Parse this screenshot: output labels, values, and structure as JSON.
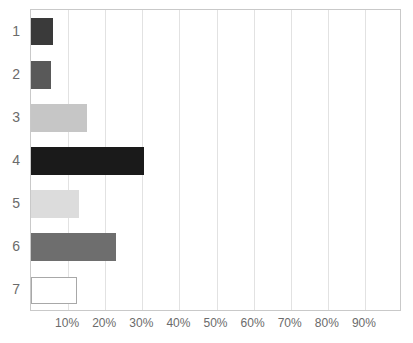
{
  "chart_data": {
    "type": "bar",
    "orientation": "horizontal",
    "title": "",
    "xlabel": "",
    "ylabel": "",
    "categories": [
      "1",
      "2",
      "3",
      "4",
      "5",
      "6",
      "7"
    ],
    "values": [
      6,
      5.5,
      15,
      30.5,
      13,
      23,
      12.5
    ],
    "value_labels": [
      "6%",
      "5.5%",
      "15%",
      "30.5%",
      "13%",
      "23%",
      "12.5%"
    ],
    "xlim": [
      0,
      100
    ],
    "xtick_values": [
      10,
      20,
      30,
      40,
      50,
      60,
      70,
      80,
      90
    ],
    "xtick_labels": [
      "10%",
      "20%",
      "30%",
      "40%",
      "50%",
      "60%",
      "70%",
      "80%",
      "90%"
    ],
    "grid": "vertical",
    "legend": null,
    "series": [
      {
        "name": "series-1",
        "values": [
          6,
          5.5,
          15,
          30.5,
          13,
          23,
          12.5
        ]
      }
    ],
    "bar_styles": [
      {
        "category": "1",
        "fill": "#3a3a3a",
        "stroke": "#3a3a3a"
      },
      {
        "category": "2",
        "fill": "#595959",
        "stroke": "#595959"
      },
      {
        "category": "3",
        "fill": "#c6c6c6",
        "stroke": "#c6c6c6"
      },
      {
        "category": "4",
        "fill": "#1a1a1a",
        "stroke": "#1a1a1a"
      },
      {
        "category": "5",
        "fill": "#dcdcdc",
        "stroke": "#dcdcdc"
      },
      {
        "category": "6",
        "fill": "#6e6e6e",
        "stroke": "#6e6e6e"
      },
      {
        "category": "7",
        "fill": "#ffffff",
        "stroke": "#a8a8a8"
      }
    ],
    "colors": {
      "plot_border": "#c9c9c9",
      "gridline": "#e2e2e2",
      "tick_text": "#6b6b6b",
      "background": "#ffffff"
    }
  }
}
